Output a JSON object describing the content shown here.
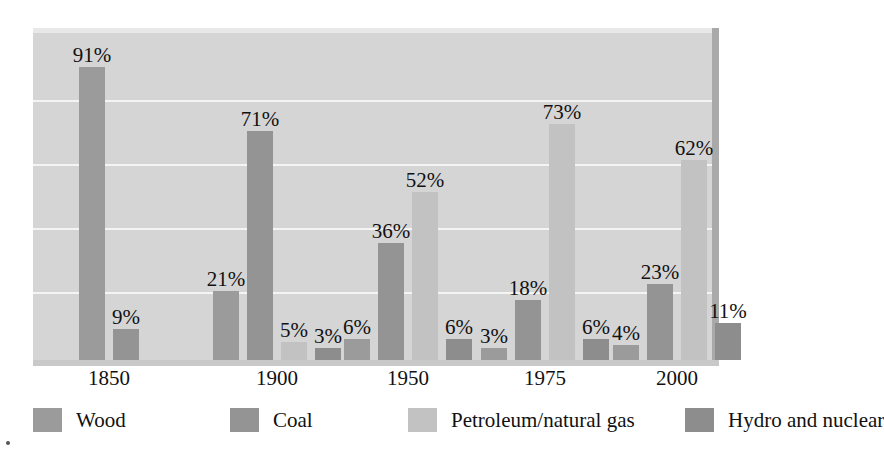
{
  "chart_data": {
    "type": "bar",
    "title": "",
    "subtitle": "",
    "xlabel": "",
    "ylabel": "",
    "ylim": [
      0,
      100
    ],
    "y_unit": "%",
    "grid": true,
    "gridlines_at": [
      20,
      40,
      60,
      80
    ],
    "legend_position": "bottom",
    "categories": [
      "1850",
      "1900",
      "1950",
      "1975",
      "2000"
    ],
    "series": [
      {
        "name": "Wood",
        "color": "#9b9b9b",
        "values": [
          91,
          21,
          6,
          3,
          4
        ],
        "labels": [
          "91%",
          "21%",
          "6%",
          "3%",
          "4%"
        ]
      },
      {
        "name": "Coal",
        "color": "#949494",
        "values": [
          9,
          71,
          36,
          18,
          23
        ],
        "labels": [
          "9%",
          "71%",
          "36%",
          "18%",
          "23%"
        ]
      },
      {
        "name": "Petroleum/natural gas",
        "color": "#c2c2c2",
        "values": [
          0,
          5,
          52,
          73,
          62
        ],
        "labels": [
          "",
          "5%",
          "52%",
          "73%",
          "62%"
        ]
      },
      {
        "name": "Hydro and nuclear",
        "color": "#8d8d8d",
        "values": [
          0,
          3,
          6,
          6,
          11
        ],
        "labels": [
          "",
          "3%",
          "6%",
          "6%",
          "11%"
        ]
      }
    ]
  },
  "legend": {
    "items": [
      {
        "label": "Wood",
        "color": "#9b9b9b"
      },
      {
        "label": "Coal",
        "color": "#949494"
      },
      {
        "label": "Petroleum/natural gas",
        "color": "#c2c2c2"
      },
      {
        "label": "Hydro and nuclear",
        "color": "#8d8d8d"
      }
    ]
  },
  "colors": {
    "plot_background": "#d5d5d5",
    "gridline": "#f4f4f4",
    "page_background": "#ffffff",
    "text": "#111111"
  }
}
